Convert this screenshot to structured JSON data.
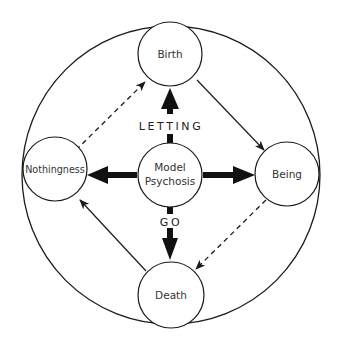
{
  "diagram": {
    "type": "cycle-diagram",
    "colors": {
      "stroke": "#1a1a1a",
      "text": "#333333",
      "background": "#ffffff"
    },
    "nodes": {
      "center": {
        "line1": "Model",
        "line2": "Psychosis"
      },
      "top": {
        "label": "Birth"
      },
      "right": {
        "label": "Being"
      },
      "bottom": {
        "label": "Death"
      },
      "left": {
        "label": "Nothingness"
      }
    },
    "flow_labels": {
      "up": "LETTING",
      "down": "GO"
    },
    "edges": [
      {
        "from": "Model Psychosis",
        "to": "Birth",
        "style": "bold"
      },
      {
        "from": "Model Psychosis",
        "to": "Being",
        "style": "bold"
      },
      {
        "from": "Model Psychosis",
        "to": "Death",
        "style": "bold"
      },
      {
        "from": "Model Psychosis",
        "to": "Nothingness",
        "style": "bold"
      },
      {
        "from": "Birth",
        "to": "Being",
        "style": "solid"
      },
      {
        "from": "Being",
        "to": "Death",
        "style": "dashed"
      },
      {
        "from": "Death",
        "to": "Nothingness",
        "style": "solid"
      },
      {
        "from": "Nothingness",
        "to": "Birth",
        "style": "dashed"
      }
    ]
  }
}
